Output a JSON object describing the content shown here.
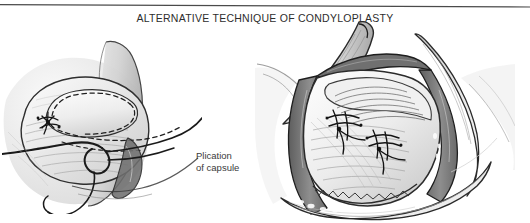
{
  "figure": {
    "title": "ALTERNATIVE TECHNIQUE OF CONDYLOPLASTY",
    "caption_line1": "Plication",
    "caption_line2": "of capsule",
    "background_color": "#ffffff",
    "ink_color": "#1a1a1a",
    "title_color": "#2d2d2d",
    "shadow_gray": "#7a7a7a",
    "midtone_gray": "#bdbdbd",
    "light_gray": "#e4e4e4"
  },
  "panels": [
    {
      "name": "left-illustration",
      "subject": "Capsule flap outlined with dashed incision lines and suture with needle and thread",
      "style": "pencil-and-wash medical illustration",
      "features": [
        "dashed flap outline",
        "suture knot",
        "curved needle",
        "trailing thread loop",
        "condylar neck shading"
      ]
    },
    {
      "name": "right-illustration",
      "subject": "Surgical exposure with retracted wound margins showing plicated capsule with two suture knots",
      "style": "pencil-and-wash medical illustration",
      "features": [
        "retractor blades",
        "wound margin shadow",
        "plicated capsule folds",
        "two suture knot clusters",
        "irregular tissue edge"
      ]
    }
  ]
}
